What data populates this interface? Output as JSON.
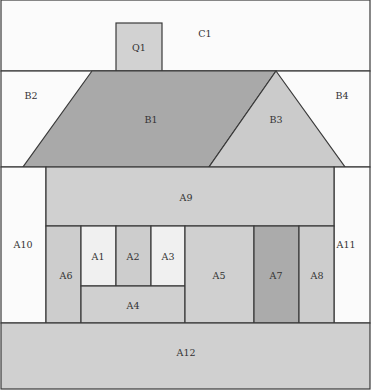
{
  "diagram": {
    "type": "house-partition-diagram",
    "colors": {
      "background": "#ffffff",
      "white_region": "#fbfbfb",
      "light_gray": "#d0d0d0",
      "window_light": "#f0f0f0",
      "roof_dark": "#a9a9a9",
      "roof_light": "#cbcbcb",
      "door_dark": "#ababab",
      "outline": "#3a3a3a"
    },
    "regions": [
      {
        "id": "C1",
        "label": "C1",
        "name": "sky-region",
        "shape": "rect",
        "x": 1,
        "y": 0,
        "w": 369,
        "h": 71,
        "fill": "#fbfbfb",
        "label_x": 205,
        "label_y": 34
      },
      {
        "id": "Q1",
        "label": "Q1",
        "name": "chimney",
        "shape": "rect",
        "x": 116,
        "y": 23,
        "w": 46,
        "h": 48,
        "fill": "#d2d2d2",
        "label_x": 139,
        "label_y": 48
      },
      {
        "id": "B2",
        "label": "B2",
        "name": "left-roof-background",
        "shape": "rect",
        "x": 1,
        "y": 71,
        "w": 369,
        "h": 96,
        "fill": "#fbfbfb",
        "label_x": 31,
        "label_y": 96
      },
      {
        "id": "B4",
        "label": "B4",
        "name": "right-roof-background",
        "shape": "none",
        "fill": "#fbfbfb",
        "label_x": 342,
        "label_y": 96
      },
      {
        "id": "B1",
        "label": "B1",
        "name": "main-roof",
        "shape": "polygon",
        "points": "92,71 276,71 209,167 23,167",
        "fill": "#a9a9a9",
        "label_x": 151,
        "label_y": 120
      },
      {
        "id": "B3",
        "label": "B3",
        "name": "gable-roof",
        "shape": "polygon",
        "points": "276,71 345,167 209,167",
        "fill": "#cbcbcb",
        "label_x": 276,
        "label_y": 120
      },
      {
        "id": "A10",
        "label": "A10",
        "name": "left-side-wall-background",
        "shape": "rect",
        "x": 1,
        "y": 167,
        "w": 45,
        "h": 156,
        "fill": "#fbfbfb",
        "label_x": 23,
        "label_y": 245
      },
      {
        "id": "A11",
        "label": "A11",
        "name": "right-side-wall-background",
        "shape": "rect",
        "x": 334,
        "y": 167,
        "w": 36,
        "h": 156,
        "fill": "#fbfbfb",
        "label_x": 346,
        "label_y": 245
      },
      {
        "id": "A9",
        "label": "A9",
        "name": "upper-wall",
        "shape": "rect",
        "x": 46,
        "y": 167,
        "w": 288,
        "h": 59,
        "fill": "#d0d0d0",
        "label_x": 186,
        "label_y": 198
      },
      {
        "id": "A6",
        "label": "A6",
        "name": "left-wall-panel",
        "shape": "rect",
        "x": 46,
        "y": 226,
        "w": 35,
        "h": 97,
        "fill": "#cdcdcd",
        "label_x": 66,
        "label_y": 276
      },
      {
        "id": "A1",
        "label": "A1",
        "name": "window-pane-left",
        "shape": "rect",
        "x": 81,
        "y": 226,
        "w": 35,
        "h": 60,
        "fill": "#f0f0f0",
        "label_x": 98,
        "label_y": 257
      },
      {
        "id": "A2",
        "label": "A2",
        "name": "window-mullion-center",
        "shape": "rect",
        "x": 116,
        "y": 226,
        "w": 35,
        "h": 60,
        "fill": "#cdcdcd",
        "label_x": 133,
        "label_y": 257
      },
      {
        "id": "A3",
        "label": "A3",
        "name": "window-pane-right",
        "shape": "rect",
        "x": 151,
        "y": 226,
        "w": 34,
        "h": 60,
        "fill": "#f0f0f0",
        "label_x": 168,
        "label_y": 257
      },
      {
        "id": "A4",
        "label": "A4",
        "name": "below-window-panel",
        "shape": "rect",
        "x": 81,
        "y": 286,
        "w": 104,
        "h": 37,
        "fill": "#d0d0d0",
        "label_x": 133,
        "label_y": 306
      },
      {
        "id": "A5",
        "label": "A5",
        "name": "center-wall-panel",
        "shape": "rect",
        "x": 185,
        "y": 226,
        "w": 69,
        "h": 97,
        "fill": "#d0d0d0",
        "label_x": 219,
        "label_y": 276
      },
      {
        "id": "A7",
        "label": "A7",
        "name": "door",
        "shape": "rect",
        "x": 254,
        "y": 226,
        "w": 45,
        "h": 97,
        "fill": "#ababab",
        "label_x": 276,
        "label_y": 276
      },
      {
        "id": "A8",
        "label": "A8",
        "name": "right-wall-panel",
        "shape": "rect",
        "x": 299,
        "y": 226,
        "w": 35,
        "h": 97,
        "fill": "#cdcdcd",
        "label_x": 317,
        "label_y": 276
      },
      {
        "id": "A12",
        "label": "A12",
        "name": "ground-foundation",
        "shape": "rect",
        "x": 1,
        "y": 323,
        "w": 369,
        "h": 66,
        "fill": "#d0d0d0",
        "label_x": 186,
        "label_y": 353
      }
    ]
  }
}
